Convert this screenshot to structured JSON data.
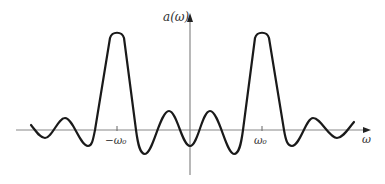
{
  "diagram": {
    "y_axis_label": "a(ω)",
    "x_axis_label": "ω",
    "tick_labels": [
      "−ω₀",
      "ω₀"
    ],
    "colors": {
      "axis": "#888888",
      "curve": "#1a1a1a",
      "text": "#333333"
    },
    "curve_points": [
      [
        31,
        125
      ],
      [
        45,
        138
      ],
      [
        65,
        118
      ],
      [
        88,
        146
      ],
      [
        95,
        130
      ],
      [
        117,
        32
      ],
      [
        135,
        130
      ],
      [
        145,
        154
      ],
      [
        169,
        111
      ],
      [
        190,
        146
      ],
      [
        210,
        111
      ],
      [
        234,
        154
      ],
      [
        243,
        130
      ],
      [
        262,
        32
      ],
      [
        284,
        130
      ],
      [
        292,
        146
      ],
      [
        313,
        118
      ],
      [
        337,
        138
      ],
      [
        354,
        122
      ]
    ]
  }
}
